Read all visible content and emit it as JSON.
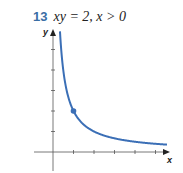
{
  "problem": {
    "number": "13",
    "expression": "xy = 2, x > 0"
  },
  "chart_data": {
    "type": "line",
    "title": "xy = 2, x > 0",
    "xlabel": "x",
    "ylabel": "y",
    "function": "y = 2/x",
    "x_ticks": [
      1,
      2,
      3,
      4,
      5
    ],
    "y_ticks": [
      1,
      2,
      3,
      4,
      5
    ],
    "tick_labels_shown": false,
    "xlim": [
      -0.6,
      5.6
    ],
    "ylim": [
      -1.0,
      6.0
    ],
    "grid": false,
    "legend": null,
    "highlighted_point": {
      "x": 1,
      "y": 2
    },
    "series": [
      {
        "name": "y = 2/x",
        "color": "#3b6fb6",
        "x": [
          0.34,
          0.4,
          0.5,
          0.6,
          0.75,
          1,
          1.25,
          1.5,
          2,
          2.5,
          3,
          3.5,
          4,
          4.5,
          5,
          5.5
        ],
        "y": [
          5.88,
          5.0,
          4.0,
          3.33,
          2.67,
          2.0,
          1.6,
          1.33,
          1.0,
          0.8,
          0.67,
          0.57,
          0.5,
          0.44,
          0.4,
          0.36
        ]
      }
    ]
  },
  "colors": {
    "curve": "#3b6fb6",
    "problem_number": "#3a6ea5",
    "axis": "#555555"
  }
}
